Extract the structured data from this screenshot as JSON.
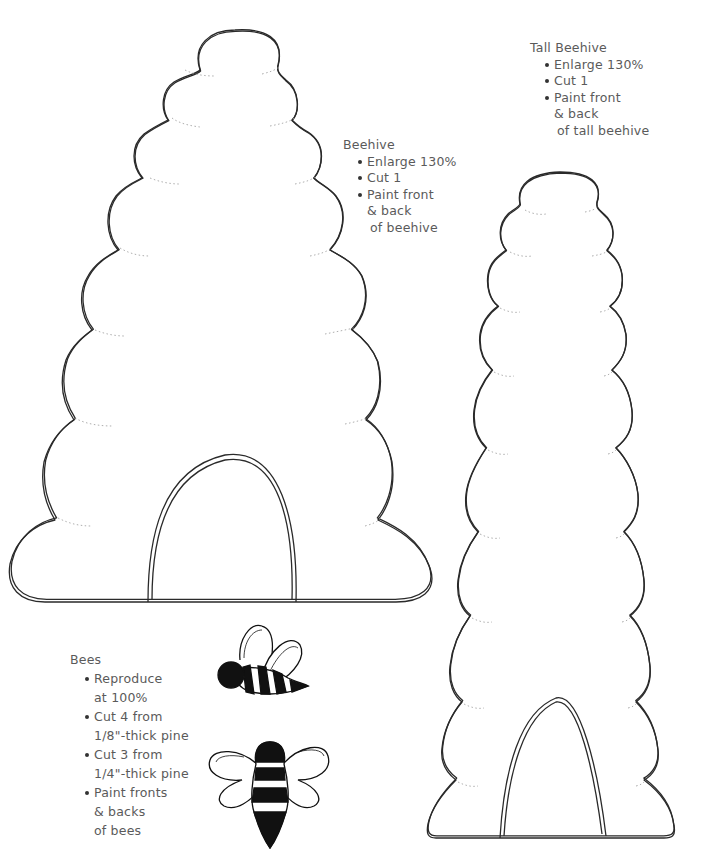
{
  "patterns": {
    "beehive": {
      "title": "Beehive",
      "instructions": [
        {
          "lines": [
            "Enlarge 130%"
          ]
        },
        {
          "lines": [
            "Cut 1"
          ]
        },
        {
          "lines": [
            "Paint front",
            "& back",
            "of beehive"
          ]
        }
      ]
    },
    "tall_beehive": {
      "title": "Tall Beehive",
      "instructions": [
        {
          "lines": [
            "Enlarge 130%"
          ]
        },
        {
          "lines": [
            "Cut 1"
          ]
        },
        {
          "lines": [
            "Paint front",
            "& back",
            "of tall beehive"
          ]
        }
      ]
    },
    "bees": {
      "title": "Bees",
      "instructions": [
        {
          "lines": [
            "Reproduce",
            "at 100%"
          ]
        },
        {
          "lines": [
            "Cut 4 from",
            "1/8\"-thick pine"
          ]
        },
        {
          "lines": [
            "Cut 3 from",
            "1/4\"-thick pine"
          ]
        },
        {
          "lines": [
            "Paint fronts",
            "& backs",
            "of bees"
          ]
        }
      ]
    }
  },
  "colors": {
    "line": "#2a2a2a",
    "text": "#5a5a5a",
    "fill_dark": "#111111",
    "background": "#ffffff"
  }
}
